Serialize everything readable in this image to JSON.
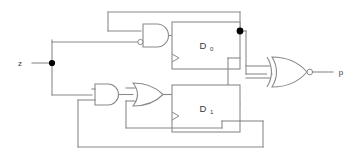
{
  "diagram": {
    "type": "logic-circuit-schematic",
    "background_color": "#ffffff",
    "wire_color": "#8a8a8a",
    "label_color": "#3a3a3a",
    "node_color": "#000000"
  },
  "ports": {
    "input": {
      "name": "z",
      "label": "z",
      "side": "left"
    },
    "output": {
      "name": "p",
      "label": "p",
      "side": "right"
    }
  },
  "flipflops": [
    {
      "id": "ff0",
      "label": "D",
      "subscript": "0",
      "full_label": "D0",
      "kind": "d-flip-flop",
      "clock_edge": "rising",
      "outputs": [
        "Q",
        "Qbar"
      ]
    },
    {
      "id": "ff1",
      "label": "D",
      "subscript": "1",
      "full_label": "D1",
      "kind": "d-flip-flop",
      "clock_edge": "rising",
      "outputs": [
        "Q",
        "Qbar"
      ]
    }
  ],
  "gates": [
    {
      "id": "and-top",
      "type": "AND",
      "name": "and-gate-top",
      "inputs": 2,
      "inverted_inputs": [
        1
      ],
      "feeds": "ff0"
    },
    {
      "id": "and-bottom",
      "type": "AND",
      "name": "and-gate-bottom",
      "inputs": 2,
      "inverted_inputs": [],
      "feeds": "or-gate"
    },
    {
      "id": "or-gate",
      "type": "OR",
      "name": "or-gate",
      "inputs": 2,
      "inverted_inputs": [],
      "feeds": "ff1"
    },
    {
      "id": "xnor-out",
      "type": "XNOR",
      "name": "xnor-output-gate",
      "inputs": 2,
      "inverted_output": true,
      "feeds": "p"
    }
  ],
  "junctions": [
    {
      "id": "j-z",
      "name": "input-z-junction",
      "label": ""
    },
    {
      "id": "j-q0",
      "name": "ff0-q-junction",
      "label": ""
    }
  ]
}
